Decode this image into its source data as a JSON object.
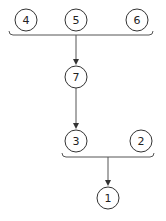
{
  "diagram": {
    "colors": {
      "stroke": "#333333",
      "line": "#555555",
      "background": "#ffffff"
    },
    "nodes": [
      {
        "id": "n4",
        "label": "4",
        "cx": 26,
        "cy": 20
      },
      {
        "id": "n5",
        "label": "5",
        "cx": 76,
        "cy": 20
      },
      {
        "id": "n6",
        "label": "6",
        "cx": 137,
        "cy": 20
      },
      {
        "id": "n7",
        "label": "7",
        "cx": 76,
        "cy": 77
      },
      {
        "id": "n3",
        "label": "3",
        "cx": 76,
        "cy": 141
      },
      {
        "id": "n2",
        "label": "2",
        "cx": 141,
        "cy": 141
      },
      {
        "id": "n1",
        "label": "1",
        "cx": 108,
        "cy": 198
      }
    ],
    "groups": [
      {
        "id": "top-group",
        "members": [
          "4",
          "5",
          "6"
        ],
        "target": "7"
      },
      {
        "id": "bottom-group",
        "members": [
          "3",
          "2"
        ],
        "target": "1"
      }
    ],
    "edges": [
      {
        "from": "group(4,5,6)",
        "to": "7"
      },
      {
        "from": "7",
        "to": "3"
      },
      {
        "from": "group(3,2)",
        "to": "1"
      }
    ]
  }
}
